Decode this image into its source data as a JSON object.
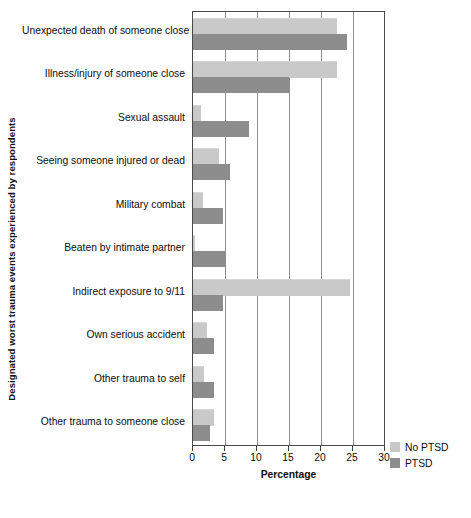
{
  "chart_data": {
    "type": "bar",
    "orientation": "horizontal",
    "title": "",
    "xlabel": "Percentage",
    "ylabel": "Designated worst trauma events experienced by respondents",
    "xlim": [
      0,
      30
    ],
    "xticks": [
      0,
      5,
      10,
      15,
      20,
      25,
      30
    ],
    "grid": true,
    "legend_position": "bottom-right",
    "categories": [
      "Unexpected death of someone close",
      "Illness/injury of someone close",
      "Sexual assault",
      "Seeing someone injured or dead",
      "Military combat",
      "Beaten by intimate partner",
      "Indirect exposure to 9/11",
      "Own serious accident",
      "Other trauma to self",
      "Other trauma to someone close"
    ],
    "series": [
      {
        "name": "No PTSD",
        "color": "#c9c9c9",
        "values": [
          22.5,
          22.5,
          1.3,
          4.0,
          1.5,
          0.3,
          24.5,
          2.2,
          1.7,
          3.3
        ]
      },
      {
        "name": "PTSD",
        "color": "#8d8d8d",
        "values": [
          24.0,
          15.0,
          8.8,
          5.7,
          4.7,
          5.1,
          4.7,
          3.3,
          3.3,
          2.6
        ]
      }
    ]
  },
  "legend": {
    "entries": [
      {
        "label": "No PTSD",
        "color": "#c9c9c9"
      },
      {
        "label": "PTSD",
        "color": "#8d8d8d"
      }
    ]
  },
  "axes": {
    "x_title": "Percentage",
    "y_title": "Designated worst trauma events experienced by respondents",
    "x_tick_labels": [
      "0",
      "5",
      "10",
      "15",
      "20",
      "25",
      "30"
    ]
  }
}
